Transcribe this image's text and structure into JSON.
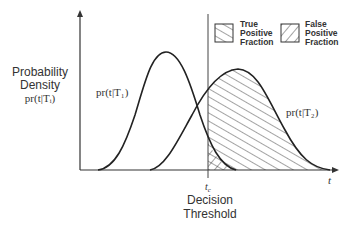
{
  "diagram": {
    "type": "roc-decision-threshold",
    "y_axis_label": [
      "Probability",
      "Density"
    ],
    "y_axis_sublabel": "pr(t|Tᵢ)",
    "x_axis_label": "t",
    "threshold_symbol": "t",
    "threshold_subscript": "c",
    "threshold_label": [
      "Decision",
      "Threshold"
    ],
    "curve1_label": "pr(t|T₁)",
    "curve2_label": "pr(t|T₂)",
    "legend": [
      {
        "label": [
          "True",
          "Positive",
          "Fraction"
        ],
        "hatch": "descending"
      },
      {
        "label": [
          "False",
          "Positive",
          "Fraction"
        ],
        "hatch": "ascending"
      }
    ],
    "colors": {
      "line": "#222222",
      "text": "#333333",
      "background": "#ffffff"
    }
  },
  "labels": {
    "y1": "Probability",
    "y2": "Density",
    "ysub": "pr(t|Tᵢ)",
    "c1": "pr(t|T₁)",
    "c2": "pr(t|T₂)",
    "xt": "t",
    "tc": "t",
    "tc_sub": "c",
    "dt1": "Decision",
    "dt2": "Threshold",
    "leg1a": "True",
    "leg1b": "Positive",
    "leg1c": "Fraction",
    "leg2a": "False",
    "leg2b": "Positive",
    "leg2c": "Fraction"
  }
}
